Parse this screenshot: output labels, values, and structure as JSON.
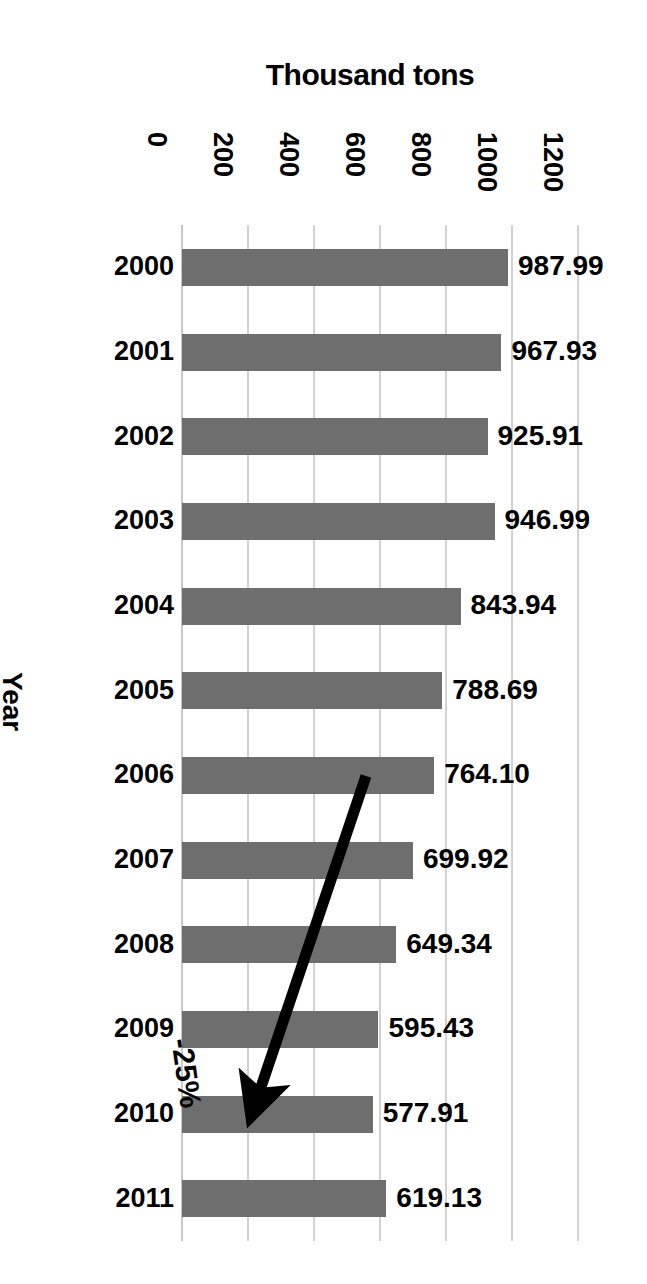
{
  "chart_data": {
    "type": "bar",
    "orientation": "horizontal",
    "title": "Thousand tons",
    "xlabel": "Thousand tons",
    "ylabel": "Year",
    "categories": [
      "2000",
      "2001",
      "2002",
      "2003",
      "2004",
      "2005",
      "2006",
      "2007",
      "2008",
      "2009",
      "2010",
      "2011"
    ],
    "values": [
      987.99,
      967.93,
      925.91,
      946.99,
      843.94,
      788.69,
      764.1,
      699.92,
      649.34,
      595.43,
      577.91,
      619.13
    ],
    "value_labels": [
      "987.99",
      "967.93",
      "925.91",
      "946.99",
      "843.94",
      "788.69",
      "764.10",
      "699.92",
      "649.34",
      "595.43",
      "577.91",
      "619.13"
    ],
    "xlim": [
      0,
      1200
    ],
    "xticks": [
      0,
      200,
      400,
      600,
      800,
      1000,
      1200
    ],
    "xtick_labels": [
      "0",
      "200",
      "400",
      "600",
      "800",
      "1000",
      "1200"
    ],
    "grid": true,
    "legend": null,
    "bar_color": "#6e6e6e",
    "grid_color": "#d2d2d2",
    "text_color": "#000000",
    "annotations": [
      {
        "text": "-25%",
        "type": "arrow",
        "from_category": "2006",
        "to_category": "2010",
        "arrow_color": "#000000"
      }
    ]
  },
  "axis": {
    "title": "Thousand tons",
    "y_title": "Year",
    "ticks": [
      "0",
      "200",
      "400",
      "600",
      "800",
      "1000",
      "1200"
    ]
  },
  "annotation": {
    "label": "-25%"
  }
}
